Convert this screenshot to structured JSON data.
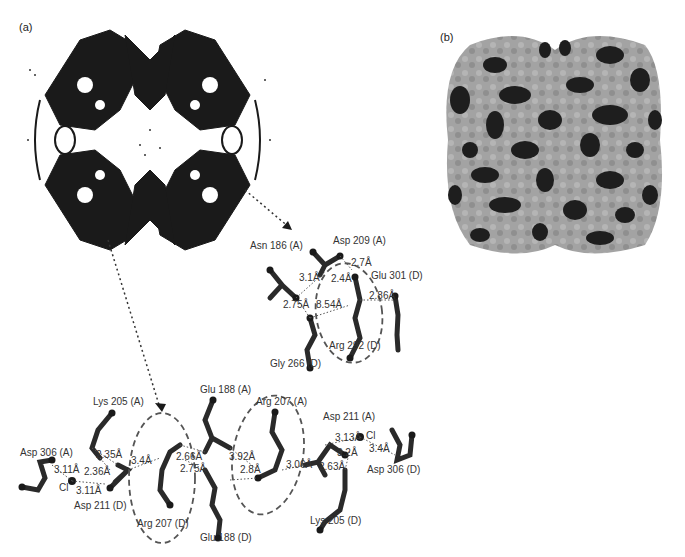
{
  "figure": {
    "panels": [
      {
        "id": "a",
        "label": "(a)",
        "content": "ribbon diagram of tetrameric protein with inter-subunit interface residues"
      },
      {
        "id": "b",
        "label": "(b)",
        "content": "space-filling surface model of tetramer, dark patches on light surface"
      }
    ],
    "interface_top": {
      "residues": [
        {
          "name": "Asn 186 (A)"
        },
        {
          "name": "Asp 209 (A)"
        },
        {
          "name": "Glu 301 (D)"
        },
        {
          "name": "Gly 266 (D)"
        },
        {
          "name": "Arg 292 (D)"
        }
      ],
      "distances": [
        "2.7Å",
        "3.1Å",
        "2.4Å",
        "2.86Å",
        "2.75Å",
        "8.54Å"
      ]
    },
    "interface_bottom": {
      "residues": [
        {
          "name": "Lys 205 (A)"
        },
        {
          "name": "Asp 306 (A)"
        },
        {
          "name": "Cl"
        },
        {
          "name": "Asp 211 (D)"
        },
        {
          "name": "Arg 207 (D)"
        },
        {
          "name": "Glu 188 (A)"
        },
        {
          "name": "Arg 207 (A)"
        },
        {
          "name": "Glu 188 (D)"
        },
        {
          "name": "Asp 211 (A)"
        },
        {
          "name": "Cl"
        },
        {
          "name": "Asp 306 (D)"
        },
        {
          "name": "Lys 205 (D)"
        }
      ],
      "distances": [
        "2.35Å",
        "3.11Å",
        "2.36Å",
        "3.11Å",
        "3.4Å",
        "2.66Å",
        "2.75Å",
        "3.92Å",
        "2.8Å",
        "3.06Å",
        "3.13Å",
        "3.2Å",
        "3.4Å",
        "2.63Å"
      ]
    },
    "colors": {
      "ink": "#1a1a1a",
      "surface_light": "#9a9a9a",
      "surface_dark": "#1e1e1e",
      "dashed": "#555555"
    }
  }
}
